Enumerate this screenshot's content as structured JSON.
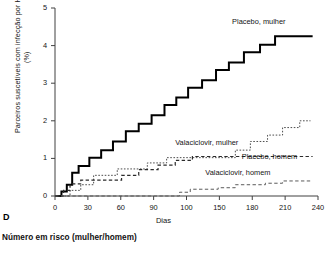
{
  "panel": {
    "letter": "D",
    "footer_note": "Número em risco (mulher/homem)"
  },
  "chart_data": {
    "type": "line",
    "title": "",
    "subtitle": "",
    "xlabel": "Dias",
    "ylabel": "Parceiros suscetíveis com infecção por HSV-2 (%)",
    "xlim": [
      0,
      245
    ],
    "ylim": [
      0,
      5
    ],
    "grid": false,
    "legend_position": "inline-annotations",
    "xticks": [
      0,
      30,
      60,
      90,
      100,
      150,
      180,
      210,
      240
    ],
    "xtick_labels": [
      "0",
      "30",
      "60",
      "90",
      "100",
      "150",
      "180",
      "210",
      "240"
    ],
    "yticks": [
      0,
      1,
      2,
      3,
      4,
      5
    ],
    "ytick_labels": [
      "0",
      "1",
      "2",
      "3",
      "4",
      "5"
    ],
    "series": [
      {
        "name": "Placebo, mulher",
        "style": "solid",
        "width": 2.0,
        "color": "#000000",
        "label_x": 165,
        "label_y": 4.62,
        "steps": [
          [
            0,
            0.0
          ],
          [
            6,
            0.0
          ],
          [
            6,
            0.12
          ],
          [
            11,
            0.12
          ],
          [
            11,
            0.3
          ],
          [
            16,
            0.3
          ],
          [
            16,
            0.62
          ],
          [
            22,
            0.62
          ],
          [
            22,
            0.8
          ],
          [
            32,
            0.8
          ],
          [
            32,
            1.02
          ],
          [
            43,
            1.02
          ],
          [
            43,
            1.22
          ],
          [
            54,
            1.22
          ],
          [
            54,
            1.45
          ],
          [
            66,
            1.45
          ],
          [
            66,
            1.72
          ],
          [
            78,
            1.72
          ],
          [
            78,
            1.92
          ],
          [
            90,
            1.92
          ],
          [
            90,
            2.15
          ],
          [
            102,
            2.15
          ],
          [
            102,
            2.42
          ],
          [
            113,
            2.42
          ],
          [
            113,
            2.62
          ],
          [
            124,
            2.62
          ],
          [
            124,
            2.88
          ],
          [
            137,
            2.88
          ],
          [
            137,
            3.08
          ],
          [
            150,
            3.08
          ],
          [
            150,
            3.35
          ],
          [
            162,
            3.35
          ],
          [
            162,
            3.55
          ],
          [
            176,
            3.55
          ],
          [
            176,
            3.82
          ],
          [
            191,
            3.82
          ],
          [
            191,
            4.02
          ],
          [
            205,
            4.02
          ],
          [
            205,
            4.25
          ],
          [
            240,
            4.25
          ]
        ]
      },
      {
        "name": "Valaciclovir, mulher",
        "style": "dotted",
        "width": 1.0,
        "color": "#4d4d4d",
        "label_x": 112,
        "label_y": 1.42,
        "steps": [
          [
            0,
            0.0
          ],
          [
            14,
            0.0
          ],
          [
            14,
            0.15
          ],
          [
            24,
            0.15
          ],
          [
            24,
            0.3
          ],
          [
            36,
            0.3
          ],
          [
            36,
            0.55
          ],
          [
            58,
            0.55
          ],
          [
            58,
            0.72
          ],
          [
            86,
            0.72
          ],
          [
            86,
            0.88
          ],
          [
            104,
            0.88
          ],
          [
            104,
            1.02
          ],
          [
            168,
            1.02
          ],
          [
            168,
            1.22
          ],
          [
            182,
            1.22
          ],
          [
            182,
            1.45
          ],
          [
            198,
            1.45
          ],
          [
            198,
            1.62
          ],
          [
            212,
            1.62
          ],
          [
            212,
            1.82
          ],
          [
            228,
            1.82
          ],
          [
            228,
            2.0
          ],
          [
            238,
            2.0
          ]
        ]
      },
      {
        "name": "Placebo, homem",
        "style": "dashed",
        "width": 1.2,
        "color": "#2b2b2b",
        "label_x": 174,
        "label_y": 1.05,
        "steps": [
          [
            0,
            0.0
          ],
          [
            8,
            0.0
          ],
          [
            8,
            0.15
          ],
          [
            14,
            0.15
          ],
          [
            14,
            0.32
          ],
          [
            24,
            0.32
          ],
          [
            24,
            0.42
          ],
          [
            62,
            0.42
          ],
          [
            62,
            0.55
          ],
          [
            78,
            0.55
          ],
          [
            78,
            0.7
          ],
          [
            96,
            0.7
          ],
          [
            96,
            0.82
          ],
          [
            112,
            0.82
          ],
          [
            112,
            0.95
          ],
          [
            128,
            0.95
          ],
          [
            128,
            1.05
          ],
          [
            240,
            1.05
          ]
        ]
      },
      {
        "name": "Valaciclovir, homem",
        "style": "dashed",
        "width": 1.0,
        "color": "#5a5a5a",
        "label_x": 140,
        "label_y": 0.62,
        "steps": [
          [
            0,
            0.0
          ],
          [
            116,
            0.0
          ],
          [
            116,
            0.1
          ],
          [
            126,
            0.1
          ],
          [
            126,
            0.18
          ],
          [
            152,
            0.18
          ],
          [
            152,
            0.22
          ],
          [
            168,
            0.22
          ],
          [
            168,
            0.3
          ],
          [
            196,
            0.3
          ],
          [
            196,
            0.34
          ],
          [
            212,
            0.34
          ],
          [
            212,
            0.4
          ],
          [
            238,
            0.4
          ]
        ]
      }
    ]
  }
}
